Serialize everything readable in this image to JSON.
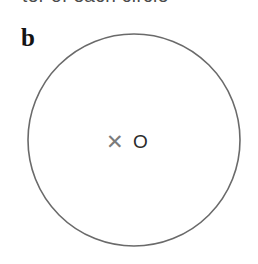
{
  "figure": {
    "background_color": "#ffffff",
    "width": 258,
    "height": 264,
    "panel_label": "b",
    "panel_label_color": "#141414"
  },
  "caption": {
    "clipped_text": "ter of each circle",
    "color": "#4a4a4a",
    "note_visible": "only the bottom edge of this line of text is visible at the top of the crop"
  },
  "circle": {
    "center_x": 134,
    "center_y": 140,
    "radius": 106,
    "stroke_color": "#6a6a6a",
    "stroke_width": 1.6,
    "fill": "none"
  },
  "center_markers": {
    "cross_symbol": "✕",
    "cross_color": "#7b7b7b",
    "circle_symbol": "O",
    "circle_color": "#2b2b2b"
  }
}
